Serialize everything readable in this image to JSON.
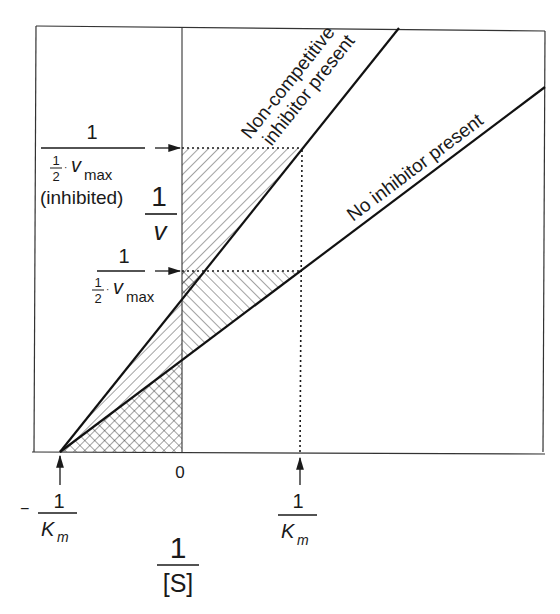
{
  "diagram": {
    "type": "Lineweaver-Burk plot",
    "y_axis_label": {
      "numerator": "1",
      "denominator": "v"
    },
    "x_axis_label": {
      "numerator": "1",
      "denominator": "[S]"
    },
    "x_origin_label": "0",
    "lines": [
      {
        "name": "non-competitive",
        "label_line1": "Non-competitive",
        "label_line2": "inhibitor present"
      },
      {
        "name": "no-inhibitor",
        "label": "No inhibitor present"
      }
    ],
    "y_markers": [
      {
        "name": "inhibited",
        "numerator": "1",
        "half_num": "1",
        "half_den": "2",
        "vmax": "v",
        "vmax_sub": "max",
        "note": "(inhibited)"
      },
      {
        "name": "uninhibited",
        "numerator": "1",
        "half_num": "1",
        "half_den": "2",
        "vmax": "v",
        "vmax_sub": "max"
      }
    ],
    "x_markers": [
      {
        "name": "negative-km",
        "sign": "−",
        "numerator": "1",
        "denominator": "K",
        "sub": "m"
      },
      {
        "name": "positive-km",
        "numerator": "1",
        "denominator": "K",
        "sub": "m"
      }
    ],
    "colors": {
      "ink": "#1a1a1a",
      "background": "#ffffff"
    }
  }
}
